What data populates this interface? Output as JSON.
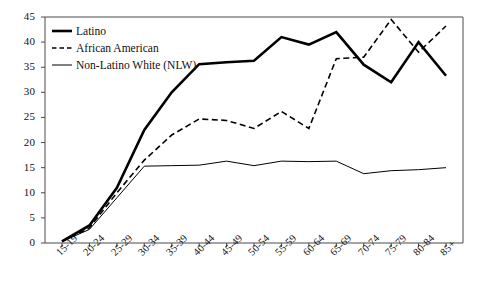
{
  "chart_data": {
    "type": "line",
    "title": "",
    "subtitle": "",
    "xlabel": "",
    "ylabel": "",
    "grid": false,
    "legend_position": "top-left",
    "xlim_categories": 15,
    "ylim": [
      0,
      45
    ],
    "ytick_step": 5,
    "yticks": [
      "0",
      "5",
      "10",
      "15",
      "20",
      "25",
      "30",
      "35",
      "40",
      "45"
    ],
    "categories": [
      "15-19",
      "20-24",
      "25-29",
      "30-34",
      "35-39",
      "40-44",
      "45-49",
      "50-54",
      "55-59",
      "60-64",
      "65-69",
      "70-74",
      "75-79",
      "80-84",
      "85+"
    ],
    "series": [
      {
        "name": "Latino",
        "style": "solid-thick",
        "color": "#000000",
        "values": [
          0.3,
          3.5,
          11.0,
          22.5,
          30.0,
          35.6,
          36.0,
          36.3,
          41.0,
          39.5,
          42.0,
          35.5,
          32.0,
          40.0,
          33.3
        ]
      },
      {
        "name": "African American",
        "style": "dashed",
        "color": "#000000",
        "values": [
          0.3,
          3.0,
          10.0,
          16.5,
          21.5,
          24.7,
          24.4,
          22.8,
          26.2,
          22.8,
          36.7,
          37.0,
          44.5,
          38.0,
          43.2
        ]
      },
      {
        "name": "Non-Latino White (NLW)",
        "style": "solid-thin",
        "color": "#000000",
        "values": [
          0.3,
          2.7,
          9.0,
          15.3,
          15.4,
          15.5,
          16.3,
          15.4,
          16.3,
          16.2,
          16.3,
          13.8,
          14.4,
          14.6,
          15.0
        ]
      }
    ],
    "legend": [
      {
        "label": "Latino",
        "style": "solid-thick"
      },
      {
        "label": "African American",
        "style": "dashed"
      },
      {
        "label": "Non-Latino White (NLW)",
        "style": "solid-thin"
      }
    ]
  },
  "colors": {
    "axis": "#4a4a4a",
    "line": "#000000",
    "background": "#ffffff"
  }
}
